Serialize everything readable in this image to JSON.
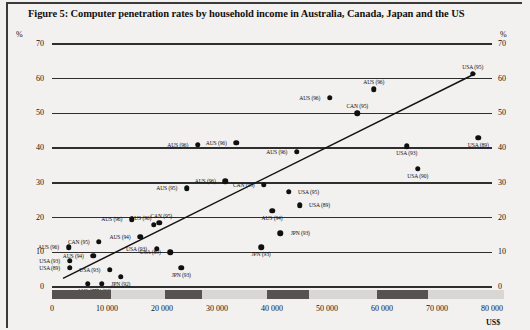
{
  "figure": {
    "title": "Figure 5: Computer penetration rates by household income in Australia, Canada, Japan and the US"
  },
  "axes": {
    "y_label_left": "%",
    "y_label_right": "%",
    "x_label": "US$",
    "y_ticks": [
      "0",
      "10",
      "20",
      "30",
      "40",
      "50",
      "60",
      "70"
    ],
    "x_ticks": [
      "0",
      "10 000",
      "20 000",
      "30 000",
      "40 000",
      "50 000",
      "60 000",
      "70 000",
      "80 000"
    ]
  },
  "chart_data": {
    "type": "scatter",
    "title": "Figure 5: Computer penetration rates by household income in Australia, Canada, Japan and the US",
    "xlabel": "US$",
    "ylabel": "%",
    "xlim": [
      0,
      80000
    ],
    "ylim": [
      0,
      70
    ],
    "grid": true,
    "legend": "none",
    "trendline": {
      "x0": 2000,
      "y0": 2.5,
      "x1": 77000,
      "y1": 61.5
    },
    "points": [
      {
        "label": "AUS (96)",
        "x": 3000,
        "y": 11.5,
        "label_pos": "left"
      },
      {
        "label": "USA (93)",
        "x": 3200,
        "y": 7.5,
        "label_pos": "left"
      },
      {
        "label": "USA (89)",
        "x": 3200,
        "y": 5.5,
        "label_pos": "left"
      },
      {
        "label": "AUS (94)",
        "x": 6500,
        "y": 1.0,
        "label_pos": "below"
      },
      {
        "label": "JPN (93)",
        "x": 9000,
        "y": 1.0,
        "label_pos": "below"
      },
      {
        "label": "CAN (95)",
        "x": 8500,
        "y": 13.0,
        "label_pos": "left"
      },
      {
        "label": "AUS (94)",
        "x": 7500,
        "y": 9.0,
        "label_pos": "left"
      },
      {
        "label": "USA (93)",
        "x": 10500,
        "y": 5.0,
        "label_pos": "left"
      },
      {
        "label": "JPN (92)",
        "x": 12500,
        "y": 3.0,
        "label_pos": "below"
      },
      {
        "label": "AUS (96)",
        "x": 14500,
        "y": 19.5,
        "label_pos": "left"
      },
      {
        "label": "AUS (94)",
        "x": 16000,
        "y": 14.5,
        "label_pos": "left"
      },
      {
        "label": "CAN (95)",
        "x": 19500,
        "y": 18.5,
        "label_pos": "above-right"
      },
      {
        "label": "AUS (96)",
        "x": 18500,
        "y": 18.0,
        "label_pos": "above-left"
      },
      {
        "label": "USA (93)",
        "x": 19000,
        "y": 11.0,
        "label_pos": "left"
      },
      {
        "label": "USA (89)",
        "x": 21500,
        "y": 10.0,
        "label_pos": "left"
      },
      {
        "label": "JPN (93)",
        "x": 23500,
        "y": 5.5,
        "label_pos": "below"
      },
      {
        "label": "AUS (95)",
        "x": 24500,
        "y": 28.5,
        "label_pos": "left"
      },
      {
        "label": "AUS (96)",
        "x": 31500,
        "y": 30.5,
        "label_pos": "left"
      },
      {
        "label": "AUS (96)",
        "x": 26500,
        "y": 41.0,
        "label_pos": "left"
      },
      {
        "label": "AUS (96)",
        "x": 33500,
        "y": 41.5,
        "label_pos": "left"
      },
      {
        "label": "AUS (96)",
        "x": 44500,
        "y": 39.0,
        "label_pos": "left"
      },
      {
        "label": "CAN (95)",
        "x": 38500,
        "y": 29.5,
        "label_pos": "left"
      },
      {
        "label": "USA (95)",
        "x": 43000,
        "y": 27.5,
        "label_pos": "right"
      },
      {
        "label": "USA (89)",
        "x": 45000,
        "y": 23.5,
        "label_pos": "right"
      },
      {
        "label": "AUS (94)",
        "x": 40000,
        "y": 22.0,
        "label_pos": "below"
      },
      {
        "label": "JPN (93)",
        "x": 41500,
        "y": 15.5,
        "label_pos": "right"
      },
      {
        "label": "JPN (93)",
        "x": 38000,
        "y": 11.5,
        "label_pos": "below"
      },
      {
        "label": "AUS (96)",
        "x": 50500,
        "y": 54.5,
        "label_pos": "left"
      },
      {
        "label": "AUS (96)",
        "x": 58500,
        "y": 57.0,
        "label_pos": "above"
      },
      {
        "label": "CAN (95)",
        "x": 55500,
        "y": 50.0,
        "label_pos": "above"
      },
      {
        "label": "USA (93)",
        "x": 64500,
        "y": 40.5,
        "label_pos": "below"
      },
      {
        "label": "USA (90)",
        "x": 66500,
        "y": 34.0,
        "label_pos": "below"
      },
      {
        "label": "USA (89)",
        "x": 77500,
        "y": 43.0,
        "label_pos": "below"
      },
      {
        "label": "USA (95)",
        "x": 76500,
        "y": 61.5,
        "label_pos": "above"
      }
    ]
  },
  "band_segments": [
    {
      "start": 0,
      "end": 10500
    },
    {
      "start": 20000,
      "end": 26500
    },
    {
      "start": 38000,
      "end": 45500
    },
    {
      "start": 57500,
      "end": 66500
    }
  ]
}
